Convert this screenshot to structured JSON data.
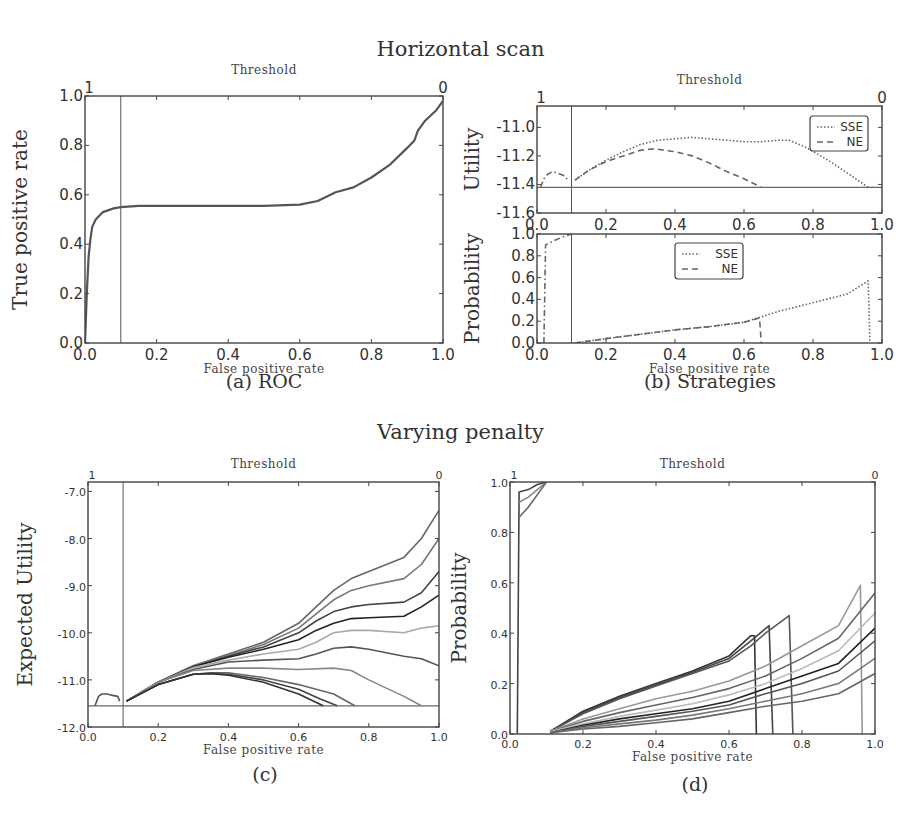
{
  "titles": {
    "top_section": "Horizontal scan",
    "bottom_section": "Varying penalty"
  },
  "captions": {
    "a": "(a) ROC",
    "b": "(b) Strategies",
    "c": "(c)",
    "d": "(d)"
  },
  "chart_data": [
    {
      "id": "a",
      "type": "line",
      "title": "Threshold",
      "xlabel": "False positive rate",
      "ylabel": "True positive rate",
      "xlim": [
        0.0,
        1.0
      ],
      "ylim": [
        0.0,
        1.0
      ],
      "xticks": [
        "0.0",
        "0.2",
        "0.4",
        "0.6",
        "0.8",
        "1.0"
      ],
      "yticks": [
        "0.0",
        "0.2",
        "0.4",
        "0.6",
        "0.8",
        "1.0"
      ],
      "top_axis_labels": [
        "1",
        "0"
      ],
      "vline_x": 0.1,
      "series": [
        {
          "name": "ROC",
          "color": "#555555",
          "style": "solid",
          "x": [
            0.0,
            0.005,
            0.01,
            0.015,
            0.02,
            0.03,
            0.05,
            0.08,
            0.1,
            0.15,
            0.3,
            0.5,
            0.6,
            0.65,
            0.7,
            0.75,
            0.8,
            0.85,
            0.9,
            0.92,
            0.93,
            0.95,
            0.98,
            1.0
          ],
          "y": [
            0.0,
            0.2,
            0.35,
            0.42,
            0.47,
            0.5,
            0.53,
            0.545,
            0.55,
            0.555,
            0.555,
            0.555,
            0.56,
            0.575,
            0.61,
            0.63,
            0.67,
            0.72,
            0.79,
            0.82,
            0.86,
            0.9,
            0.94,
            0.98
          ]
        }
      ]
    },
    {
      "id": "b-top",
      "type": "line",
      "title": "Threshold",
      "xlabel": "",
      "ylabel": "Utility",
      "xlim": [
        0.0,
        1.0
      ],
      "ylim": [
        -11.6,
        -10.85
      ],
      "xticks": [
        "0.0",
        "0.2",
        "0.4",
        "0.6",
        "0.8",
        "1.0"
      ],
      "yticks": [
        "-11.6",
        "-11.4",
        "-11.2",
        "-11.0"
      ],
      "top_axis_labels": [
        "1",
        "0"
      ],
      "vline_x": 0.1,
      "hline_y": -11.42,
      "legend": {
        "position": "upper right",
        "entries": [
          "SSE",
          "NE"
        ]
      },
      "series": [
        {
          "name": "SSE",
          "color": "#666666",
          "style": "dotted",
          "x": [
            0.11,
            0.15,
            0.2,
            0.25,
            0.3,
            0.35,
            0.4,
            0.45,
            0.5,
            0.55,
            0.6,
            0.65,
            0.7,
            0.73,
            0.78,
            0.85,
            0.9,
            0.96
          ],
          "y": [
            -11.37,
            -11.3,
            -11.23,
            -11.17,
            -11.12,
            -11.09,
            -11.08,
            -11.07,
            -11.08,
            -11.09,
            -11.1,
            -11.1,
            -11.09,
            -11.09,
            -11.14,
            -11.24,
            -11.32,
            -11.42
          ]
        },
        {
          "name": "NE",
          "color": "#666666",
          "style": "dashed",
          "x": [
            0.11,
            0.15,
            0.2,
            0.25,
            0.3,
            0.34,
            0.4,
            0.45,
            0.5,
            0.55,
            0.6,
            0.65
          ],
          "y": [
            -11.37,
            -11.3,
            -11.24,
            -11.2,
            -11.16,
            -11.15,
            -11.17,
            -11.2,
            -11.25,
            -11.31,
            -11.36,
            -11.42
          ]
        },
        {
          "name": "early",
          "color": "#666666",
          "style": "dashdot",
          "x": [
            0.01,
            0.02,
            0.03,
            0.045,
            0.06,
            0.08,
            0.09
          ],
          "y": [
            -11.42,
            -11.36,
            -11.33,
            -11.31,
            -11.32,
            -11.34,
            -11.37
          ]
        }
      ]
    },
    {
      "id": "b-bottom",
      "type": "line",
      "title": "",
      "xlabel": "False positive rate",
      "ylabel": "Probability",
      "xlim": [
        0.0,
        1.0
      ],
      "ylim": [
        0.0,
        1.0
      ],
      "xticks": [
        "0.0",
        "0.2",
        "0.4",
        "0.6",
        "0.8",
        "1.0"
      ],
      "yticks": [
        "0.0",
        "0.2",
        "0.4",
        "0.6",
        "0.8",
        "1.0"
      ],
      "vline_x": 0.1,
      "legend": {
        "position": "upper center",
        "entries": [
          "SSE",
          "NE"
        ]
      },
      "series": [
        {
          "name": "SSE",
          "color": "#666666",
          "style": "dotted",
          "x": [
            0.11,
            0.2,
            0.3,
            0.4,
            0.5,
            0.6,
            0.65,
            0.7,
            0.8,
            0.9,
            0.96,
            0.965
          ],
          "y": [
            0.0,
            0.04,
            0.08,
            0.12,
            0.15,
            0.19,
            0.24,
            0.29,
            0.37,
            0.45,
            0.57,
            0.0
          ]
        },
        {
          "name": "NE",
          "color": "#666666",
          "style": "dashed",
          "x": [
            0.11,
            0.2,
            0.3,
            0.4,
            0.5,
            0.6,
            0.645,
            0.65
          ],
          "y": [
            0.0,
            0.04,
            0.08,
            0.12,
            0.15,
            0.19,
            0.23,
            0.0
          ]
        },
        {
          "name": "early",
          "color": "#666666",
          "style": "dashdot",
          "x": [
            0.02,
            0.025,
            0.05,
            0.08,
            0.1
          ],
          "y": [
            0.0,
            0.9,
            0.94,
            0.98,
            1.0
          ]
        }
      ]
    },
    {
      "id": "c",
      "type": "line",
      "title": "Threshold",
      "xlabel": "False positive rate",
      "ylabel": "Expected Utility",
      "xlim": [
        0.0,
        1.0
      ],
      "ylim": [
        -12.0,
        -6.8
      ],
      "xticks": [
        "0.0",
        "0.2",
        "0.4",
        "0.6",
        "0.8",
        "1.0"
      ],
      "yticks": [
        "-12.0",
        "-11.0",
        "-10.0",
        "-9.0",
        "-8.0",
        "-7.0"
      ],
      "top_axis_labels": [
        "1",
        "0"
      ],
      "vline_x": 0.1,
      "hline_y": -11.55,
      "series": [
        {
          "name": "p1",
          "color": "#666666",
          "x": [
            0.11,
            0.2,
            0.3,
            0.4,
            0.5,
            0.6,
            0.65,
            0.7,
            0.75,
            0.8,
            0.9,
            0.95,
            1.0
          ],
          "y": [
            -11.45,
            -11.05,
            -10.7,
            -10.45,
            -10.2,
            -9.8,
            -9.45,
            -9.1,
            -8.85,
            -8.7,
            -8.4,
            -8.0,
            -7.4
          ]
        },
        {
          "name": "p2",
          "color": "#777777",
          "x": [
            0.11,
            0.2,
            0.3,
            0.4,
            0.5,
            0.6,
            0.65,
            0.7,
            0.75,
            0.8,
            0.9,
            0.95,
            1.0
          ],
          "y": [
            -11.45,
            -11.05,
            -10.7,
            -10.48,
            -10.25,
            -9.9,
            -9.6,
            -9.3,
            -9.1,
            -9.0,
            -8.85,
            -8.55,
            -8.0
          ]
        },
        {
          "name": "p3",
          "color": "#444444",
          "x": [
            0.11,
            0.2,
            0.3,
            0.4,
            0.5,
            0.6,
            0.65,
            0.7,
            0.75,
            0.8,
            0.9,
            0.95,
            1.0
          ],
          "y": [
            -11.45,
            -11.05,
            -10.72,
            -10.5,
            -10.3,
            -10.0,
            -9.75,
            -9.55,
            -9.45,
            -9.4,
            -9.35,
            -9.15,
            -8.7
          ]
        },
        {
          "name": "p4",
          "color": "#222222",
          "x": [
            0.11,
            0.2,
            0.3,
            0.4,
            0.5,
            0.6,
            0.65,
            0.7,
            0.75,
            0.8,
            0.9,
            0.95,
            1.0
          ],
          "y": [
            -11.45,
            -11.05,
            -10.72,
            -10.52,
            -10.35,
            -10.15,
            -9.95,
            -9.8,
            -9.7,
            -9.68,
            -9.65,
            -9.45,
            -9.2
          ]
        },
        {
          "name": "p5",
          "color": "#aaaaaa",
          "x": [
            0.11,
            0.2,
            0.3,
            0.4,
            0.5,
            0.6,
            0.65,
            0.7,
            0.75,
            0.8,
            0.9,
            0.95,
            1.0
          ],
          "y": [
            -11.45,
            -11.05,
            -10.74,
            -10.58,
            -10.45,
            -10.35,
            -10.2,
            -10.0,
            -9.95,
            -9.95,
            -10.0,
            -9.9,
            -9.85
          ]
        },
        {
          "name": "p6",
          "color": "#555555",
          "x": [
            0.11,
            0.2,
            0.3,
            0.4,
            0.5,
            0.6,
            0.65,
            0.7,
            0.75,
            0.8,
            0.9,
            0.95,
            1.0
          ],
          "y": [
            -11.45,
            -11.05,
            -10.78,
            -10.62,
            -10.58,
            -10.55,
            -10.45,
            -10.33,
            -10.3,
            -10.35,
            -10.5,
            -10.55,
            -10.7
          ]
        },
        {
          "name": "p7",
          "color": "#888888",
          "x": [
            0.11,
            0.2,
            0.3,
            0.4,
            0.5,
            0.6,
            0.7,
            0.75,
            0.8,
            0.9,
            0.95
          ],
          "y": [
            -11.45,
            -11.05,
            -10.8,
            -10.75,
            -10.75,
            -10.78,
            -10.75,
            -10.8,
            -11.0,
            -11.35,
            -11.55
          ]
        },
        {
          "name": "p8",
          "color": "#666666",
          "x": [
            0.11,
            0.2,
            0.3,
            0.35,
            0.4,
            0.5,
            0.6,
            0.7,
            0.76
          ],
          "y": [
            -11.45,
            -11.1,
            -10.88,
            -10.85,
            -10.85,
            -10.95,
            -11.1,
            -11.3,
            -11.55
          ]
        },
        {
          "name": "p9",
          "color": "#444444",
          "x": [
            0.11,
            0.2,
            0.3,
            0.35,
            0.4,
            0.5,
            0.6,
            0.66,
            0.71
          ],
          "y": [
            -11.45,
            -11.1,
            -10.88,
            -10.86,
            -10.88,
            -11.0,
            -11.2,
            -11.4,
            -11.55
          ]
        },
        {
          "name": "p10",
          "color": "#333333",
          "x": [
            0.11,
            0.2,
            0.3,
            0.35,
            0.4,
            0.5,
            0.6,
            0.67
          ],
          "y": [
            -11.45,
            -11.1,
            -10.88,
            -10.87,
            -10.9,
            -11.05,
            -11.3,
            -11.55
          ]
        },
        {
          "name": "early",
          "color": "#555555",
          "x": [
            0.02,
            0.03,
            0.04,
            0.055,
            0.07,
            0.085,
            0.09
          ],
          "y": [
            -11.55,
            -11.35,
            -11.3,
            -11.3,
            -11.33,
            -11.35,
            -11.45
          ]
        }
      ]
    },
    {
      "id": "d",
      "type": "line",
      "title": "Threshold",
      "xlabel": "False positive rate",
      "ylabel": "Probability",
      "xlim": [
        0.0,
        1.0
      ],
      "ylim": [
        0.0,
        1.0
      ],
      "xticks": [
        "0.0",
        "0.2",
        "0.4",
        "0.6",
        "0.8",
        "1.0"
      ],
      "yticks": [
        "0.0",
        "0.2",
        "0.4",
        "0.6",
        "0.8",
        "1.0"
      ],
      "top_axis_labels": [
        "1",
        "0"
      ],
      "series": [
        {
          "name": "q1",
          "color": "#333333",
          "x": [
            0.11,
            0.2,
            0.3,
            0.4,
            0.5,
            0.6,
            0.66,
            0.67,
            0.675
          ],
          "y": [
            0.01,
            0.09,
            0.15,
            0.2,
            0.25,
            0.31,
            0.39,
            0.39,
            0.0
          ]
        },
        {
          "name": "q2",
          "color": "#444444",
          "x": [
            0.11,
            0.2,
            0.3,
            0.4,
            0.5,
            0.6,
            0.66,
            0.71,
            0.72
          ],
          "y": [
            0.01,
            0.085,
            0.145,
            0.195,
            0.245,
            0.3,
            0.37,
            0.43,
            0.0
          ]
        },
        {
          "name": "q3",
          "color": "#555555",
          "x": [
            0.11,
            0.2,
            0.3,
            0.4,
            0.5,
            0.6,
            0.66,
            0.7,
            0.765,
            0.775
          ],
          "y": [
            0.01,
            0.08,
            0.14,
            0.19,
            0.24,
            0.29,
            0.35,
            0.4,
            0.47,
            0.0
          ]
        },
        {
          "name": "q4",
          "color": "#999999",
          "x": [
            0.11,
            0.2,
            0.3,
            0.4,
            0.5,
            0.6,
            0.7,
            0.8,
            0.9,
            0.96,
            0.965
          ],
          "y": [
            0.01,
            0.06,
            0.1,
            0.14,
            0.17,
            0.21,
            0.27,
            0.35,
            0.43,
            0.59,
            0.0
          ]
        },
        {
          "name": "q5",
          "color": "#666666",
          "x": [
            0.11,
            0.2,
            0.3,
            0.4,
            0.5,
            0.6,
            0.7,
            0.8,
            0.9,
            1.0
          ],
          "y": [
            0.01,
            0.05,
            0.085,
            0.115,
            0.145,
            0.18,
            0.23,
            0.3,
            0.38,
            0.56
          ]
        },
        {
          "name": "q6",
          "color": "#bbbbbb",
          "x": [
            0.11,
            0.2,
            0.3,
            0.4,
            0.5,
            0.6,
            0.7,
            0.8,
            0.9,
            1.0
          ],
          "y": [
            0.01,
            0.04,
            0.07,
            0.095,
            0.12,
            0.155,
            0.2,
            0.26,
            0.33,
            0.48
          ]
        },
        {
          "name": "q7",
          "color": "#222222",
          "x": [
            0.11,
            0.2,
            0.3,
            0.4,
            0.5,
            0.6,
            0.7,
            0.8,
            0.9,
            1.0
          ],
          "y": [
            0.005,
            0.035,
            0.06,
            0.08,
            0.1,
            0.13,
            0.18,
            0.23,
            0.28,
            0.42
          ]
        },
        {
          "name": "q8",
          "color": "#555555",
          "x": [
            0.11,
            0.2,
            0.3,
            0.4,
            0.5,
            0.6,
            0.7,
            0.8,
            0.9,
            1.0
          ],
          "y": [
            0.005,
            0.03,
            0.05,
            0.07,
            0.09,
            0.115,
            0.16,
            0.2,
            0.25,
            0.37
          ]
        },
        {
          "name": "q9",
          "color": "#777777",
          "x": [
            0.11,
            0.2,
            0.3,
            0.4,
            0.5,
            0.6,
            0.7,
            0.8,
            0.9,
            1.0
          ],
          "y": [
            0.005,
            0.025,
            0.04,
            0.055,
            0.075,
            0.1,
            0.13,
            0.16,
            0.2,
            0.3
          ]
        },
        {
          "name": "q10",
          "color": "#666666",
          "x": [
            0.11,
            0.2,
            0.3,
            0.4,
            0.5,
            0.6,
            0.7,
            0.8,
            0.9,
            1.0
          ],
          "y": [
            0.005,
            0.02,
            0.03,
            0.045,
            0.06,
            0.085,
            0.11,
            0.13,
            0.16,
            0.24
          ]
        },
        {
          "name": "early-a",
          "color": "#444444",
          "x": [
            0.02,
            0.025,
            0.05,
            0.075,
            0.1
          ],
          "y": [
            0.0,
            0.96,
            0.97,
            0.99,
            1.0
          ]
        },
        {
          "name": "early-b",
          "color": "#888888",
          "x": [
            0.025,
            0.05,
            0.075,
            0.1
          ],
          "y": [
            0.92,
            0.94,
            0.97,
            1.0
          ]
        },
        {
          "name": "early-c",
          "color": "#666666",
          "x": [
            0.025,
            0.05,
            0.075,
            0.1
          ],
          "y": [
            0.86,
            0.9,
            0.95,
            1.0
          ]
        }
      ]
    }
  ]
}
